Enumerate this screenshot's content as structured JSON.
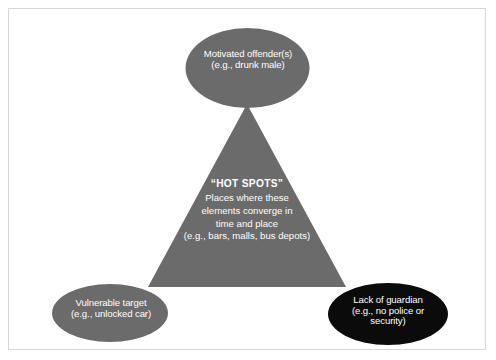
{
  "figure": {
    "type": "crime-triangle-diagram",
    "background_color": "#ffffff",
    "frame_color": "#d8d8d8"
  },
  "palette": {
    "grey_fill": "#6b6b6b",
    "black_fill": "#0b0b0b",
    "text_color": "#ffffff"
  },
  "nodes": {
    "top": {
      "id": "motivated-offender",
      "shape": "ellipse",
      "fill": "#6b6b6b",
      "line1": "Motivated offender(s)",
      "line2": "(e.g., drunk male)"
    },
    "bottom_left": {
      "id": "vulnerable-target",
      "shape": "ellipse",
      "fill": "#6b6b6b",
      "line1": "Vulnerable target",
      "line2": "(e.g., unlocked car)"
    },
    "bottom_right": {
      "id": "lack-of-guardian",
      "shape": "ellipse",
      "fill": "#0b0b0b",
      "line1": "Lack of guardian",
      "line2": "(e.g., no police or",
      "line3": "security)"
    }
  },
  "center": {
    "id": "hot-spots",
    "shape": "triangle",
    "fill": "#6b6b6b",
    "heading": "“HOT SPOTS”",
    "line1": "Places where these",
    "line2": "elements converge in",
    "line3": "time and place",
    "line4": "(e.g., bars, malls, bus depots)"
  }
}
